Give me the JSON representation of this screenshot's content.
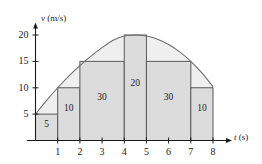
{
  "figure": {
    "background_color": "#ffffff",
    "curve_fill_color": "#efefef",
    "rect_fill_color": "#dcdcdc",
    "line_color": "#595959",
    "axis_color": "#1a1a1a"
  },
  "axes": {
    "y": {
      "label_var": "v",
      "label_units": "(m/s)",
      "ticks": [
        "5",
        "10",
        "15",
        "20"
      ],
      "tick_values": [
        5,
        10,
        15,
        20
      ],
      "range": [
        0,
        22
      ]
    },
    "x": {
      "label_var": "t",
      "label_units": "(s)",
      "ticks": [
        "1",
        "2",
        "3",
        "4",
        "5",
        "6",
        "7",
        "8"
      ],
      "tick_values": [
        1,
        2,
        3,
        4,
        5,
        6,
        7,
        8
      ],
      "range": [
        0,
        9
      ]
    }
  },
  "chart_data": {
    "type": "bar",
    "title": "",
    "xlabel": "t (s)",
    "ylabel": "v (m/s)",
    "xlim": [
      0,
      9
    ],
    "ylim": [
      0,
      22
    ],
    "grid": false,
    "legend": "none",
    "categories": [
      "0-1",
      "1-2",
      "2-4",
      "4-5",
      "5-7",
      "7-8"
    ],
    "values": [
      5,
      10,
      15,
      20,
      15,
      10
    ],
    "bars": [
      {
        "x0": 0,
        "x1": 1,
        "height": 5,
        "area_label": "5"
      },
      {
        "x0": 1,
        "x1": 2,
        "height": 10,
        "area_label": "10"
      },
      {
        "x0": 2,
        "x1": 4,
        "height": 15,
        "area_label": "30"
      },
      {
        "x0": 4,
        "x1": 5,
        "height": 20,
        "area_label": "20"
      },
      {
        "x0": 5,
        "x1": 7,
        "height": 15,
        "area_label": "30"
      },
      {
        "x0": 7,
        "x1": 8,
        "height": 10,
        "area_label": "10"
      }
    ],
    "series": [
      {
        "name": "velocity curve",
        "x": [
          0,
          0.5,
          1,
          1.5,
          2,
          2.5,
          3,
          3.5,
          4,
          4.5,
          5,
          5.5,
          6,
          6.5,
          7,
          7.5,
          8
        ],
        "values": [
          5.0,
          7.6,
          10.0,
          12.2,
          14.2,
          16.0,
          17.6,
          19.0,
          19.8,
          20.0,
          19.8,
          19.2,
          18.2,
          16.8,
          15.0,
          12.8,
          10.2
        ]
      }
    ],
    "annotations": [
      "5",
      "10",
      "30",
      "20",
      "30",
      "10"
    ]
  }
}
